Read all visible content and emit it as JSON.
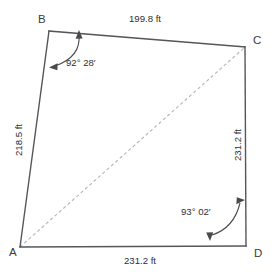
{
  "figure": {
    "background_color": "#ffffff",
    "edge_color": "#57565a",
    "diagonal_color": "#b4b3b6",
    "text_color": "#2f2e32"
  },
  "vertices": [
    {
      "id": "A",
      "label": "A",
      "x": 20,
      "y": 247,
      "label_x": 9,
      "label_y": 256
    },
    {
      "id": "B",
      "label": "B",
      "x": 49,
      "y": 31,
      "label_x": 38,
      "label_y": 23
    },
    {
      "id": "C",
      "label": "C",
      "x": 245,
      "y": 47,
      "label_x": 253,
      "label_y": 44
    },
    {
      "id": "D",
      "label": "D",
      "x": 246,
      "y": 246,
      "label_x": 254,
      "label_y": 257
    }
  ],
  "edges": [
    {
      "id": "AB",
      "from": "A",
      "to": "B",
      "label": "218.5 ft",
      "style": "solid",
      "label_x": 22,
      "label_y": 140,
      "rotation": -90
    },
    {
      "id": "BC",
      "from": "B",
      "to": "C",
      "label": "199.8 ft",
      "style": "solid",
      "label_x": 145,
      "label_y": 22,
      "rotation": 0
    },
    {
      "id": "CD",
      "from": "C",
      "to": "D",
      "label": "231.2 ft",
      "style": "solid",
      "label_x": 241,
      "label_y": 145,
      "rotation": -90
    },
    {
      "id": "AD",
      "from": "A",
      "to": "D",
      "label": "231.2 ft",
      "style": "solid",
      "label_x": 140,
      "label_y": 264,
      "rotation": 0
    }
  ],
  "diagonal": {
    "id": "AC",
    "from": "A",
    "to": "C",
    "style": "dashed",
    "label": ""
  },
  "angles": [
    {
      "id": "angle-B",
      "vertex": "B",
      "label": "92° 28′",
      "degrees": 92,
      "minutes": 28,
      "label_x": 66,
      "label_y": 66
    },
    {
      "id": "angle-D",
      "vertex": "D",
      "label": "93° 02′",
      "degrees": 93,
      "minutes": 2,
      "label_x": 181,
      "label_y": 215
    }
  ],
  "units": "ft"
}
